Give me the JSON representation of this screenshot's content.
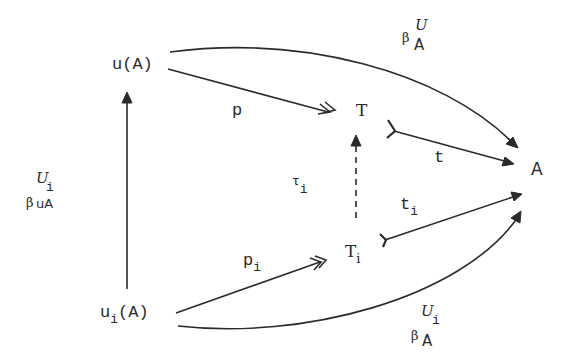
{
  "diagram": {
    "type": "commutative-diagram",
    "nodes": {
      "uA": {
        "label": "u(A)"
      },
      "uiA": {
        "base": "u",
        "sub": "i",
        "rest": "(A)"
      },
      "T": {
        "label": "T"
      },
      "Ti": {
        "base": "T",
        "sub": "i"
      },
      "A": {
        "label": "A"
      }
    },
    "edges": {
      "p": {
        "label": "p",
        "from": "u(A)",
        "to": "T",
        "style": "double-head (epimorphism)"
      },
      "pi": {
        "base": "p",
        "sub": "i",
        "from": "u_i(A)",
        "to": "T_i",
        "style": "double-head (epimorphism)"
      },
      "t": {
        "label": "t",
        "from": "T",
        "to": "A",
        "style": "tail (monomorphism)"
      },
      "ti": {
        "base": "t",
        "sub": "i",
        "from": "T_i",
        "to": "A",
        "style": "tail (monomorphism)"
      },
      "tau_i": {
        "base": "τ",
        "sub": "i",
        "from": "T_i",
        "to": "T",
        "style": "dashed"
      },
      "beta_uA": {
        "base": "β",
        "sup": "U",
        "sub": "A",
        "from": "u(A)",
        "to": "A",
        "style": "curved"
      },
      "beta_uiA": {
        "base": "β",
        "sup": "U",
        "supsub": "i",
        "sub": "A",
        "from": "u_i(A)",
        "to": "A",
        "style": "curved"
      },
      "beta_left": {
        "base": "β",
        "sup": "U",
        "supsub": "i",
        "sub": "uA",
        "from": "u_i(A)",
        "to": "u(A)",
        "style": "vertical"
      }
    },
    "colors": {
      "ink": "#2a2a2a",
      "background": "#ffffff"
    }
  }
}
